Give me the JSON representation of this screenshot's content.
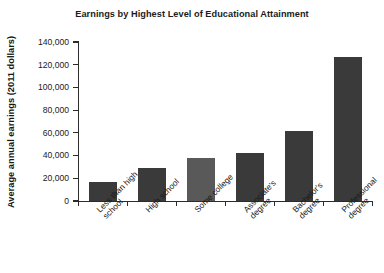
{
  "chart_data": {
    "type": "bar",
    "title": "Earnings by Highest Level of Educational Attainment",
    "xlabel": "",
    "ylabel": "Average annual earnings (2011 dollars)",
    "categories": [
      "Less than high\nschool",
      "High school",
      "Some college",
      "Associate's\ndegree",
      "Bachelor's\ndegree",
      "Professional\ndegree"
    ],
    "values": [
      17000,
      29000,
      38000,
      42000,
      61500,
      127000
    ],
    "ylim": [
      0,
      140000
    ],
    "ytick_values": [
      0,
      20000,
      40000,
      60000,
      80000,
      100000,
      120000,
      140000
    ],
    "ytick_labels": [
      "0",
      "20,000",
      "40,000",
      "60,000",
      "80,000",
      "100,000",
      "120,000",
      "140,000"
    ],
    "grid": false,
    "legend": null,
    "bar_colors": [
      "#3a3a3a",
      "#3a3a3a",
      "#595959",
      "#3a3a3a",
      "#3a3a3a",
      "#3a3a3a"
    ],
    "axis_color": "#2b2b2b",
    "background": "#ffffff"
  }
}
